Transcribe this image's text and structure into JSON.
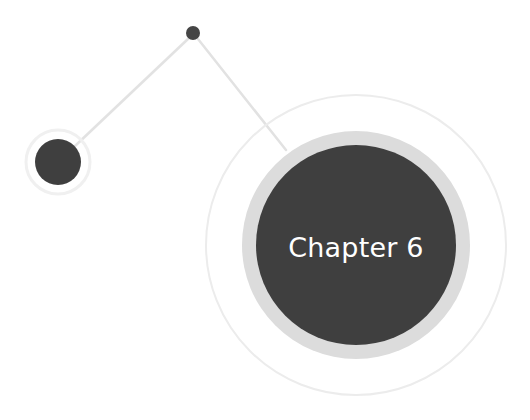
{
  "chapter": {
    "label": "Chapter 6"
  },
  "colors": {
    "background": "#ffffff",
    "dark_fill": "#3f3f3f",
    "halo": "#dcdcdc",
    "faint_ring": "#ececec",
    "connector": "#e4e4e4",
    "label_text": "#ffffff"
  },
  "nodes": [
    {
      "name": "top-dot",
      "cx": 193,
      "cy": 33,
      "r": 7
    },
    {
      "name": "left-dot",
      "cx": 58,
      "cy": 162,
      "r": 23,
      "halo_r": 32
    },
    {
      "name": "chapter-circle",
      "cx": 356,
      "cy": 245,
      "r": 100,
      "halo_r": 114,
      "outer_ring_r": 150
    }
  ]
}
